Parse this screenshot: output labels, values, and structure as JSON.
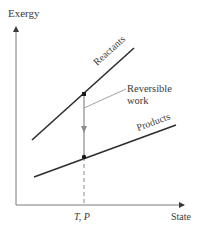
{
  "diagram": {
    "y_axis_label": "Exergy",
    "x_axis_label": "State",
    "x_tick_label": "T, P",
    "reactants_label": "Reactants",
    "products_label": "Products",
    "annotation_line1": "Reversible",
    "annotation_line2": "work",
    "colors": {
      "axis": "#6b6b6b",
      "reactants_line": "#2e2e2e",
      "products_line": "#2e2e2e",
      "work_arrow": "#8a8a8a",
      "leader": "#8a8a8a",
      "text": "#3a3a3a"
    }
  }
}
